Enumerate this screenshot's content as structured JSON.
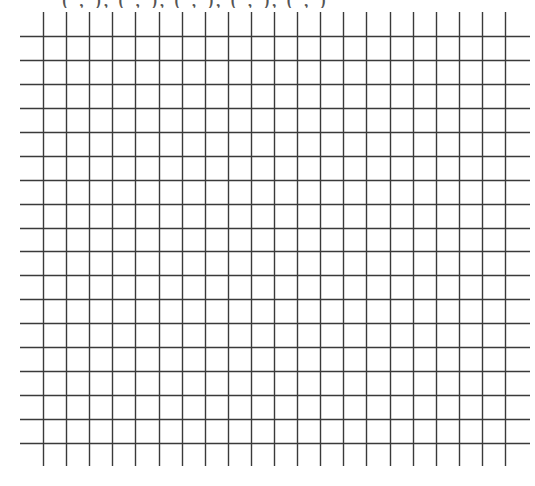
{
  "header": {
    "clipped_text": "( ,  ), ( ,  ), ( ,  ), ( ,  ), ( ,  )"
  },
  "grid": {
    "line_color": "#3a3a3a",
    "horizontal_line_count": 18,
    "vertical_line_count": 21,
    "h_start_y": 36,
    "h_step": 23.94,
    "h_x1": 20,
    "h_x2": 530,
    "v_start_x": 43,
    "v_step": 23.1,
    "v_y1": 12,
    "v_y2": 466
  }
}
